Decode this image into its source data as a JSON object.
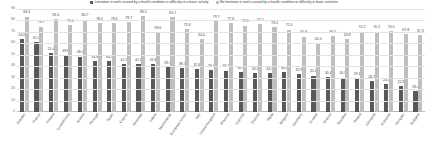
{
  "chart_data": {
    "type": "bar",
    "title": "",
    "xlabel": "",
    "ylabel": "",
    "ylim": [
      0,
      90
    ],
    "yticks": [
      0,
      10,
      20,
      30,
      40,
      50,
      60,
      70,
      80,
      90
    ],
    "grid": true,
    "legend_position": "top-center",
    "colors": {
      "series_1": "#595959",
      "series_2": "#bfbfbf"
    },
    "categories": [
      "Sweden",
      "France",
      "Finland",
      "Luxembourg",
      "Austria",
      "Portugal",
      "Spain",
      "Cyprus",
      "Denmark",
      "Latvia",
      "Netherlands",
      "European Union",
      "Italy",
      "United Kingdom",
      "Slovenia",
      "Czechia",
      "Estonia",
      "Malta",
      "Belgium",
      "Germany",
      "Croatia",
      "Greece",
      "Slovakia",
      "Poland",
      "Lithuania",
      "Romania",
      "Hungary",
      "Bulgaria"
    ],
    "series": [
      {
        "name": "Limitation in work caused by a health condition or difficulty in a basic activity",
        "color": "#595959",
        "values": [
          64.0,
          61.0,
          51.4,
          49.8,
          48.4,
          44.8,
          44.3,
          41.9,
          41.8,
          41.8,
          39.2,
          38.7,
          37.6,
          36.4,
          36.2,
          35.1,
          34.3,
          34.3,
          34.8,
          32.9,
          31.8,
          30.4,
          30.1,
          29.8,
          26.7,
          24.1,
          22.8,
          18.4
        ]
      },
      {
        "name": "No limitation in work caused by a health condition or difficulty in basic activities",
        "color": "#bfbfbf",
        "values": [
          83.4,
          74.7,
          81.0,
          75.6,
          80.7,
          78.0,
          78.0,
          78.7,
          83.5,
          69.6,
          83.2,
          72.8,
          64.0,
          79.7,
          77.8,
          75.5,
          77.0,
          74.0,
          72.0,
          65.9,
          60.3,
          66.5,
          63.8,
          70.2,
          70.2,
          70.4,
          67.8,
          67.3
        ]
      }
    ],
    "last_value_extra": 67.3
  },
  "legend": {
    "item_1": "Limitation in work caused by a health condition or difficulty in a basic activity",
    "item_2": "No limitation in work caused by a health condition or difficulty in basic activities"
  }
}
